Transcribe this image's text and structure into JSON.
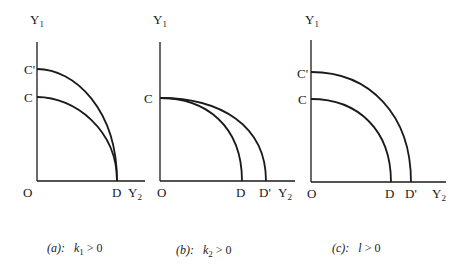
{
  "figure": {
    "panels": [
      {
        "id": "a",
        "y_axis_label": "Y",
        "y_axis_sub": "1",
        "x_axis_label": "Y",
        "x_axis_sub": "2",
        "origin_label": "O",
        "y_intercepts": [
          "C'",
          "C"
        ],
        "x_intercepts": [
          "D"
        ],
        "caption_prefix": "(a):",
        "caption_var": "k",
        "caption_sub": "1",
        "caption_rel": " > 0"
      },
      {
        "id": "b",
        "y_axis_label": "Y",
        "y_axis_sub": "1",
        "x_axis_label": "Y",
        "x_axis_sub": "2",
        "origin_label": "O",
        "y_intercepts": [
          "C"
        ],
        "x_intercepts": [
          "D",
          "D'"
        ],
        "caption_prefix": "(b):",
        "caption_var": "k",
        "caption_sub": "2",
        "caption_rel": " > 0"
      },
      {
        "id": "c",
        "y_axis_label": "Y",
        "y_axis_sub": "1",
        "x_axis_label": "Y",
        "x_axis_sub": "2",
        "origin_label": "O",
        "y_intercepts": [
          "C'",
          "C"
        ],
        "x_intercepts": [
          "D",
          "D'"
        ],
        "caption_prefix": "(c):",
        "caption_var": "l",
        "caption_sub": "",
        "caption_rel": " > 0"
      }
    ]
  }
}
